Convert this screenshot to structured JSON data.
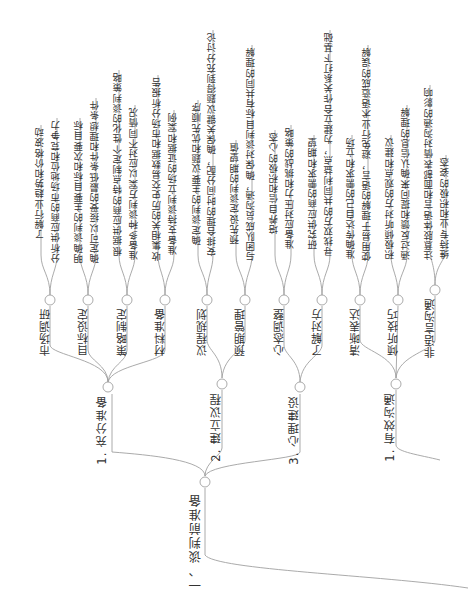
{
  "mindmap": {
    "root": "一、谈判前准备",
    "branches": [
      {
        "label": "1. 充分准备",
        "children": [
          {
            "label": "市场调研",
            "leaves": [
              "了解行业趋势和价格波动",
              "分析供应商的市场地位和竞争力"
            ]
          },
          {
            "label": "目标设定",
            "leaves": [
              "明确谈判的主要目标和次要目标",
              "确定可以接受的最低条件和理想条件"
            ]
          },
          {
            "label": "策略制定",
            "leaves": [
              "根据供应商的特点制定个性化的谈判策略",
              "准备多种谈判方案以应对不同情况"
            ]
          },
          {
            "label": "材料准备",
            "leaves": [
              "收集相关的历史交易数据和市场分析报告",
              "准备支持谈判立场的证据和案例"
            ]
          }
        ]
      },
      {
        "label": "2. 建立议程",
        "children": [
          {
            "label": "议程规划",
            "leaves": [
              "确定谈判的主要议题和优先顺序",
              "安排合理的时间分配，确保关键议题得到充分讨论"
            ]
          },
          {
            "label": "预期管理",
            "leaves": [
              "预先设定谈判的期望值",
              "与团队成员沟通，确保对谈判目标有共同的理解"
            ]
          }
        ]
      },
      {
        "label": "3. 心理建设",
        "children": [
          {
            "label": "心态调整",
            "leaves": [
              "培养自信和积极的心态",
              "准备应对压力和挑战的策略"
            ]
          },
          {
            "label": "了解对方",
            "leaves": [
              "研究供应商的需求和期望",
              "寻找双方的共同利益点，为建立合作关系打下基础"
            ]
          }
        ]
      },
      {
        "label": "1. 有效沟通",
        "children": [
          {
            "label": "清晰表达",
            "leaves": [
              "准确传达自己的需求和立场",
              "使用易于理解的语言，避免行业术语造成的误解"
            ]
          },
          {
            "label": "倾听技巧",
            "leaves": [
              "积极倾听对方的观点和建议",
              "通过反馈和提问来确认信息的理解"
            ]
          },
          {
            "label": "非语言沟通",
            "leaves": [
              "注意肢体语言和面部表情对沟通的影响",
              "维持专业和积极的姿态"
            ]
          }
        ]
      }
    ]
  },
  "colors": {
    "line": "#9a9a9a",
    "text": "#333333",
    "background": "#ffffff"
  }
}
